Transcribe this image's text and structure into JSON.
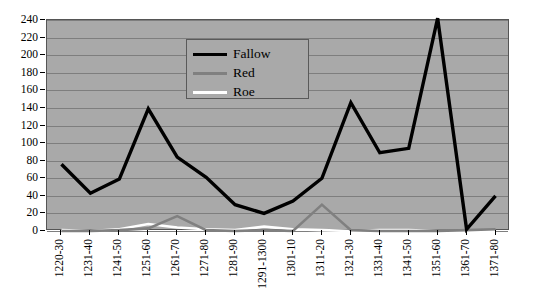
{
  "chart_data": {
    "type": "line",
    "title": "",
    "xlabel": "",
    "ylabel": "",
    "ylim": [
      0,
      240
    ],
    "ytick_step": 20,
    "yticks": [
      240,
      220,
      200,
      180,
      160,
      140,
      120,
      100,
      80,
      60,
      40,
      20,
      0
    ],
    "grid": true,
    "legend_position": "top-center",
    "plot_background": "#a9a9a9",
    "categories": [
      "1220-30",
      "1231-40",
      "1241-50",
      "1251-60",
      "1261-70",
      "1271-80",
      "1281-90",
      "1291-1300",
      "1301-10",
      "1311-20",
      "1321-30",
      "1331-40",
      "1341-50",
      "1351-60",
      "1361-70",
      "1371-80"
    ],
    "series": [
      {
        "name": "Fallow",
        "color": "#000000",
        "values": [
          76,
          43,
          59,
          139,
          84,
          61,
          30,
          20,
          34,
          60,
          146,
          89,
          94,
          242,
          2,
          40
        ]
      },
      {
        "name": "Red",
        "color": "#808080",
        "values": [
          0,
          0,
          1,
          3,
          17,
          1,
          0,
          1,
          0,
          30,
          1,
          0,
          0,
          0,
          1,
          2
        ]
      },
      {
        "name": "Roe",
        "color": "#ffffff",
        "values": [
          1,
          0,
          2,
          8,
          4,
          2,
          1,
          5,
          2,
          1,
          0,
          1,
          1,
          0,
          0,
          0
        ]
      }
    ]
  },
  "legend": {
    "entries": [
      {
        "label": "Fallow",
        "color": "#000000"
      },
      {
        "label": "Red",
        "color": "#808080"
      },
      {
        "label": "Roe",
        "color": "#ffffff"
      }
    ]
  }
}
